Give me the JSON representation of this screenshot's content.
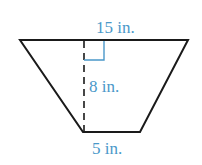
{
  "figure": {
    "shape": "trapezoid",
    "labels": {
      "top_base": "15 in.",
      "height": "8 in.",
      "bottom_base": "5 in."
    },
    "colors": {
      "outline": "#1a1a1a",
      "label": "#4a98c9",
      "right_angle_marker": "#4a98c9",
      "height_line": "#1a1a1a"
    }
  }
}
